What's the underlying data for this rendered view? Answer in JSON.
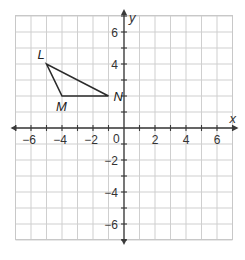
{
  "diagram": {
    "type": "coordinate-plane",
    "x_axis": {
      "label": "x",
      "min": -7,
      "max": 7,
      "tick_labels": [
        "-6",
        "-4",
        "-2",
        "2",
        "4",
        "6"
      ],
      "tick_values": [
        -6,
        -4,
        -2,
        2,
        4,
        6
      ]
    },
    "y_axis": {
      "label": "y",
      "min": -7,
      "max": 7,
      "tick_labels": [
        "6",
        "4",
        "-2",
        "-4",
        "-6"
      ],
      "tick_values": [
        6,
        4,
        -2,
        -4,
        -6
      ]
    },
    "origin_label": "0",
    "grid": true,
    "triangle": {
      "vertices": [
        {
          "name": "L",
          "x": -5,
          "y": 4
        },
        {
          "name": "M",
          "x": -4,
          "y": 2
        },
        {
          "name": "N",
          "x": -1,
          "y": 2
        }
      ]
    },
    "special_labels": {
      "N_at_y2_axis": "N"
    }
  }
}
